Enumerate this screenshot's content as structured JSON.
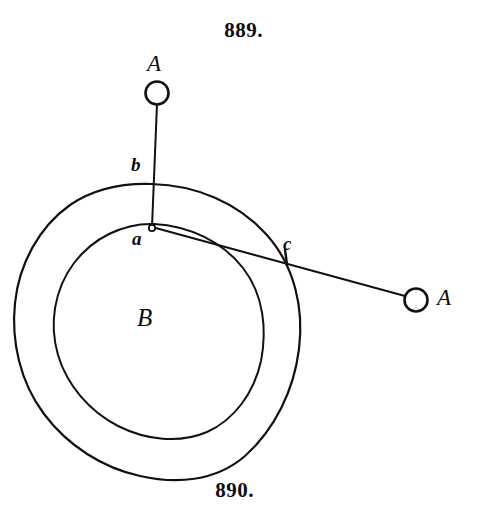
{
  "figure": {
    "caption_top": "889.",
    "caption_bottom": "890.",
    "ink_color": "#111111",
    "background_color": "#ffffff"
  },
  "labels": {
    "ball_top": "A",
    "ball_right": "A",
    "point_b": "b",
    "point_a": "a",
    "point_c": "c",
    "body_center": "B"
  },
  "geometry": {
    "outer_circle": {
      "cx": 155,
      "cy": 330,
      "r": 146
    },
    "inner_circle": {
      "cx": 157,
      "cy": 325,
      "r": 105
    },
    "pivot_point": {
      "x": 152,
      "y": 227
    },
    "ball_top": {
      "cx": 157,
      "cy": 93,
      "r": 11
    },
    "ball_right": {
      "cx": 416,
      "cy": 300,
      "r": 11
    },
    "point_b": {
      "x": 152,
      "y": 176
    },
    "point_c": {
      "x": 285,
      "y": 256
    },
    "vertical_cord": {
      "x1": 157,
      "y1": 104,
      "x2": 152,
      "y2": 227
    },
    "diagonal_cord": {
      "x1": 152,
      "y1": 227,
      "x2": 405,
      "y2": 296
    }
  }
}
